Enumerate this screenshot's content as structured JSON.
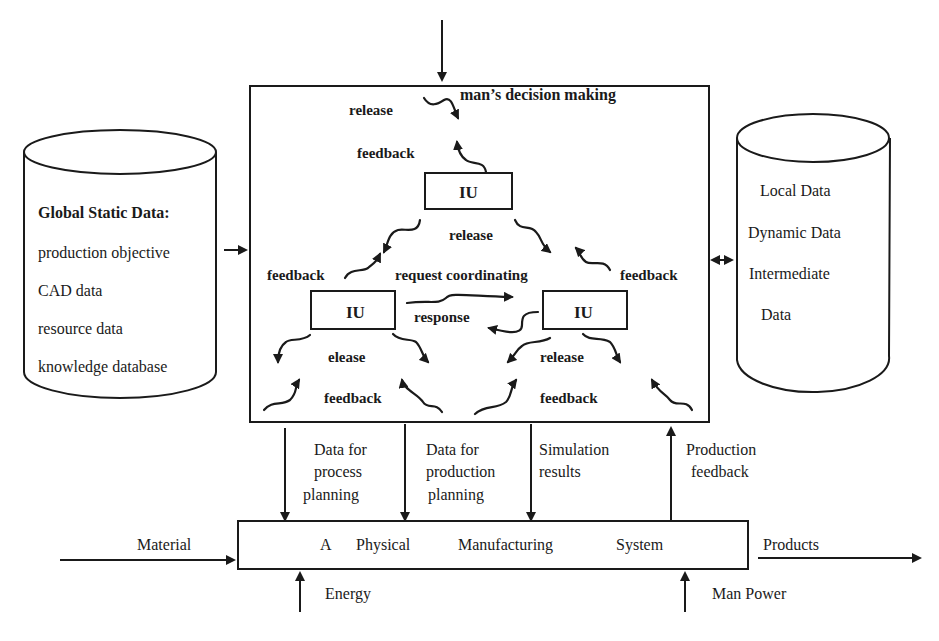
{
  "diagram": {
    "top_input": "man’s decision making",
    "global_store": {
      "title": "Global Static Data:",
      "items": [
        "production objective",
        "CAD data",
        "resource data",
        "knowledge database"
      ]
    },
    "local_store": {
      "items": [
        "Local Data",
        "Dynamic Data",
        "Intermediate",
        "Data"
      ]
    },
    "control_box": {
      "units": [
        "IU",
        "IU",
        "IU"
      ],
      "labels": {
        "top_release": "release",
        "top_feedback": "feedback",
        "mid_release": "release",
        "left_feedback": "feedback",
        "request": "request coordinating",
        "right_feedback": "feedback",
        "response": "response",
        "left_release": "elease",
        "right_release": "release",
        "bottom_left_feedback": "feedback",
        "bottom_right_feedback": "feedback"
      }
    },
    "flows_down": [
      [
        "Data for",
        "process",
        "planning"
      ],
      [
        "Data for",
        "production",
        "planning"
      ],
      [
        "Simulation",
        "results"
      ]
    ],
    "flow_up": [
      "Production",
      "feedback"
    ],
    "physical_system": {
      "label_words": [
        "A",
        "Physical",
        "Manufacturing",
        "System"
      ],
      "input": "Material",
      "output": "Products",
      "bottom_inputs": [
        "Energy",
        "Man Power"
      ]
    }
  }
}
